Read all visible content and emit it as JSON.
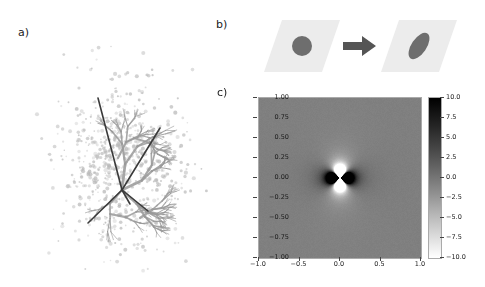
{
  "figure": {
    "panels": [
      {
        "id": "a",
        "label": "a)"
      },
      {
        "id": "b",
        "label": "b)"
      },
      {
        "id": "c",
        "label": "c)"
      }
    ]
  },
  "panel_a": {
    "label": "a)",
    "description": "scatter point cloud with dark branching skeleton overlay",
    "point_color": "#b8b8b8",
    "branch_color": "#9a9a9a",
    "skeleton_color": "#3a3a3a",
    "point_count": 700
  },
  "panel_b": {
    "label": "b)",
    "description": "shear transformation: circle maps to tilted ellipse",
    "tile_color": "#ececec",
    "shape_color": "#6e6e6e",
    "arrow_color": "#555555",
    "arrow_icon": "right-arrow-icon",
    "before_shape": "circle",
    "after_shape": "tilted-ellipse"
  },
  "chart_data": {
    "type": "heatmap",
    "title": "",
    "xlabel": "",
    "ylabel": "",
    "xlim": [
      -1.0,
      1.0
    ],
    "ylim": [
      -1.0,
      1.0
    ],
    "zlim": [
      -10.0,
      10.0
    ],
    "colormap": "gray_reversed",
    "grid": false,
    "pattern": "quadrupole",
    "xticks": [
      "-1.0",
      "-0.5",
      "0.0",
      "0.5",
      "1.0"
    ],
    "xtick_values": [
      -1.0,
      -0.5,
      0.0,
      0.5,
      1.0
    ],
    "yticks": [
      "1.00",
      "0.75",
      "0.50",
      "0.25",
      "0.00",
      "-0.25",
      "-0.50",
      "-0.75",
      "-1.00"
    ],
    "ytick_values": [
      1.0,
      0.75,
      0.5,
      0.25,
      0.0,
      -0.25,
      -0.5,
      -0.75,
      -1.0
    ],
    "colorbar": {
      "position": "right",
      "ticks": [
        "10.0",
        "7.5",
        "5.0",
        "2.5",
        "0.0",
        "-2.5",
        "-5.0",
        "-7.5",
        "-10.0"
      ],
      "tick_values": [
        10.0,
        7.5,
        5.0,
        2.5,
        0.0,
        -2.5,
        -5.0,
        -7.5,
        -10.0
      ],
      "max_color": "#000000",
      "min_color": "#ffffff"
    }
  }
}
